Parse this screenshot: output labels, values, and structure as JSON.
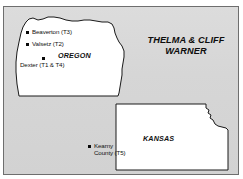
{
  "figure": {
    "title": "THELMA & CLIFF WARNER",
    "title_line1": "THELMA & CLIFF",
    "title_line2": "WARNER",
    "background_color": "#d6d6d6",
    "land_color": "#ffffff",
    "outline_color": "#1a1a1a",
    "marker_color": "#0a0a0a"
  },
  "states": [
    {
      "name": "OREGON",
      "label": "OREGON",
      "cities": [
        {
          "name": "Beaverton",
          "tag": "T3",
          "label": "Beaverton (T3)"
        },
        {
          "name": "Valsetz",
          "tag": "T2",
          "label": "Valsetz (T2)"
        },
        {
          "name": "Dexter",
          "tag": "T1 & T4",
          "label": "Dexter (T1 & T4)"
        }
      ]
    },
    {
      "name": "KANSAS",
      "label": "KANSAS",
      "cities": [
        {
          "name": "Kearny County",
          "tag": "T5",
          "label": "Kearny County (T5)",
          "label_line1": "Kearny",
          "label_line2": "County (T5)"
        }
      ]
    }
  ]
}
